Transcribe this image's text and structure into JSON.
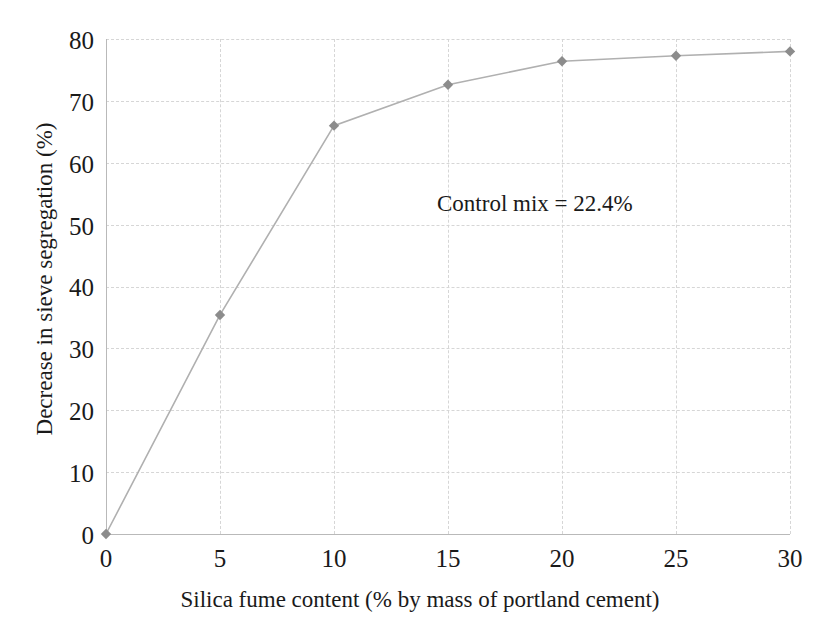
{
  "chart_data": {
    "type": "line",
    "title": "",
    "subtitle": "",
    "xlabel": "Silica fume content (% by mass of portland cement)",
    "ylabel": "Decrease in sieve segregation (%)",
    "xlim": [
      0,
      30
    ],
    "ylim": [
      0,
      80
    ],
    "xticks": [
      0,
      5,
      10,
      15,
      20,
      25,
      30
    ],
    "yticks": [
      0,
      10,
      20,
      30,
      40,
      50,
      60,
      70,
      80
    ],
    "xtick_labels": [
      "0",
      "5",
      "10",
      "15",
      "20",
      "25",
      "30"
    ],
    "ytick_labels": [
      "0",
      "10",
      "20",
      "30",
      "40",
      "50",
      "60",
      "70",
      "80"
    ],
    "grid": true,
    "grid_style": "dashed",
    "legend": false,
    "legend_position": "none",
    "x": [
      0,
      5,
      10,
      15,
      20,
      25,
      30
    ],
    "values": [
      0,
      35.4,
      66.0,
      72.6,
      76.4,
      77.3,
      78.0
    ],
    "series": [
      {
        "name": "Decrease in sieve segregation",
        "values": [
          0,
          35.4,
          66.0,
          72.6,
          76.4,
          77.3,
          78.0
        ],
        "marker": "diamond",
        "line_color": "#b0b0b0",
        "marker_color": "#8c8c8c"
      }
    ],
    "annotations": [
      {
        "text": "Control mix = 22.4%",
        "x": 19.5,
        "y": 55
      }
    ],
    "colors": {
      "line": "#b0b0b0",
      "marker": "#8c8c8c",
      "grid": "#d6d6d6",
      "axis": "#b9b9b9",
      "text": "#1a1a1a",
      "background": "#ffffff"
    }
  }
}
